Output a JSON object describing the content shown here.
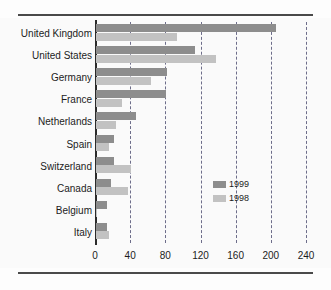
{
  "chart_data": {
    "type": "bar",
    "orientation": "horizontal",
    "title": "",
    "subtitle": "",
    "xlabel": "",
    "ylabel": "",
    "xlim": [
      0,
      240
    ],
    "xticks": [
      0,
      40,
      80,
      120,
      160,
      200,
      240
    ],
    "xtick_labels": [
      "0",
      "40",
      "80",
      "120",
      "160",
      "200",
      "240"
    ],
    "grid": true,
    "grid_style": "dashed-vertical",
    "legend_position": "middle-right",
    "categories": [
      "United Kingdom",
      "United States",
      "Germany",
      "France",
      "Netherlands",
      "Spain",
      "Switzerland",
      "Canada",
      "Belgium",
      "Italy"
    ],
    "series": [
      {
        "name": "1999",
        "color": "#8d8d8d",
        "values": [
          205,
          113,
          81,
          80,
          46,
          21,
          20,
          17,
          13,
          12
        ]
      },
      {
        "name": "1998",
        "color": "#c2c2c2",
        "values": [
          92,
          136,
          63,
          30,
          23,
          15,
          40,
          36,
          1,
          15
        ]
      }
    ]
  },
  "legend": {
    "items": [
      {
        "label": "1999",
        "color": "#8d8d8d"
      },
      {
        "label": "1998",
        "color": "#c2c2c2"
      }
    ]
  },
  "colors": {
    "series_1999": "#8d8d8d",
    "series_1998": "#c2c2c2",
    "axis": "#2b2b2b",
    "gridline": "#6d6d8a",
    "rule": "#4a4a4a",
    "text": "#1c1c1c",
    "plot_background": "#fafafa"
  }
}
